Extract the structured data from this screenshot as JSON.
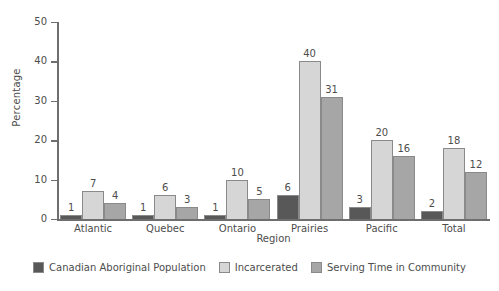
{
  "chart_data": {
    "type": "bar",
    "title": "",
    "xlabel": "Region",
    "ylabel": "Percentage",
    "categories": [
      "Atlantic",
      "Quebec",
      "Ontario",
      "Prairies",
      "Pacific",
      "Total"
    ],
    "series": [
      {
        "name": "Canadian Aboriginal Population",
        "color": "#585858",
        "values": [
          1,
          1,
          1,
          6,
          3,
          2
        ]
      },
      {
        "name": "Incarcerated",
        "color": "#d6d6d6",
        "values": [
          7,
          6,
          10,
          40,
          20,
          18
        ]
      },
      {
        "name": "Serving Time in Community",
        "color": "#a6a6a6",
        "values": [
          4,
          3,
          5,
          31,
          16,
          12
        ]
      }
    ],
    "ylim": [
      0,
      50
    ],
    "yticks": [
      0,
      10,
      20,
      30,
      40,
      50
    ],
    "ytick_labels": [
      "0",
      "10",
      "20",
      "30",
      "40",
      "50"
    ],
    "grid": false,
    "legend_position": "bottom",
    "show_data_labels": true
  }
}
